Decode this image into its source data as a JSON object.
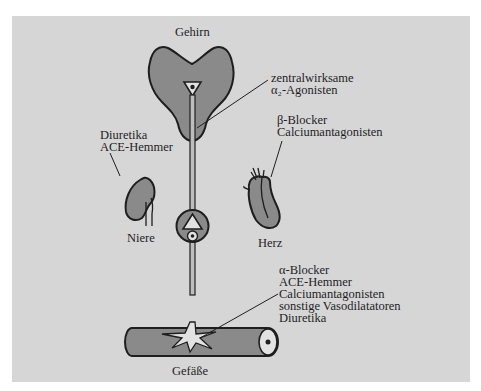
{
  "diagram": {
    "type": "blood pressure drug action sites",
    "colors": {
      "background": "#d6d6d6",
      "organ_fill": "#8a8a8a",
      "outline": "#1e1e1e",
      "nerve_fill": "#bdbdbd"
    },
    "organs": {
      "brain": {
        "label": "Gehirn"
      },
      "kidney": {
        "label": "Niere"
      },
      "heart": {
        "label": "Herz"
      },
      "vessel": {
        "label": "Gefäße"
      }
    },
    "annotations": {
      "brain": {
        "lines": [
          "zentralwirksame",
          "α₂-Agonisten"
        ]
      },
      "kidney": {
        "lines": [
          "Diuretika",
          "ACE-Hemmer"
        ]
      },
      "heart": {
        "lines": [
          "β-Blocker",
          "Calciumantagonisten"
        ]
      },
      "vessel": {
        "lines": [
          "α-Blocker",
          "ACE-Hemmer",
          "Calciumantagonisten",
          "sonstige Vasodilatatoren",
          "Diuretika"
        ]
      }
    }
  }
}
